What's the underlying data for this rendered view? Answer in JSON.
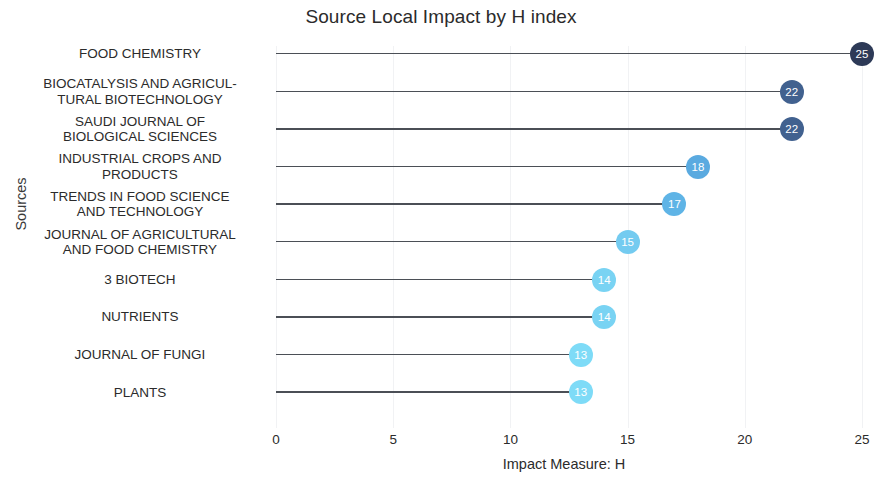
{
  "chart_data": {
    "type": "bar",
    "subtype": "lollipop",
    "title": "Source Local Impact by H index",
    "xlabel": "Impact Measure: H",
    "ylabel": "Sources",
    "xlim": [
      0,
      25
    ],
    "xticks": [
      0,
      5,
      10,
      15,
      20,
      25
    ],
    "grid": true,
    "legend": false,
    "categories": [
      "FOOD CHEMISTRY",
      "BIOCATALYSIS AND AGRICUL-\nTURAL BIOTECHNOLOGY",
      "SAUDI JOURNAL OF\nBIOLOGICAL SCIENCES",
      "INDUSTRIAL CROPS AND\nPRODUCTS",
      "TRENDS IN FOOD SCIENCE\nAND TECHNOLOGY",
      "JOURNAL OF AGRICULTURAL\nAND FOOD CHEMISTRY",
      "3 BIOTECH",
      "NUTRIENTS",
      "JOURNAL OF FUNGI",
      "PLANTS"
    ],
    "values": [
      25,
      22,
      22,
      18,
      17,
      15,
      14,
      14,
      13,
      13
    ],
    "point_labels": [
      "25",
      "22",
      "22",
      "18",
      "17",
      "15",
      "14",
      "14",
      "13",
      "13"
    ],
    "point_colors": [
      "#2d3a57",
      "#41618f",
      "#41618f",
      "#5aaae0",
      "#5fb4e6",
      "#74cbf0",
      "#79d3f3",
      "#79d3f3",
      "#7edbf7",
      "#7edbf7"
    ],
    "stem_color": "#4b4f56",
    "grid_color": "#f1f2f4",
    "tick_labels": [
      "0",
      "5",
      "10",
      "15",
      "20",
      "25"
    ],
    "background": "#ffffff"
  }
}
